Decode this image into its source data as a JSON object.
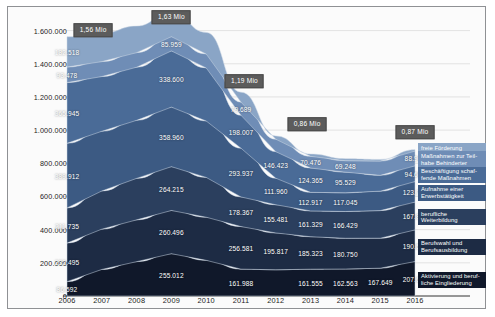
{
  "chart_data": {
    "type": "area",
    "stacked": true,
    "title": "",
    "xlabel": "",
    "ylabel": "",
    "categories": [
      "2006",
      "2007",
      "2008",
      "2009",
      "2010",
      "2011",
      "2012",
      "2013",
      "2014",
      "2015",
      "2016"
    ],
    "ylim": [
      0,
      1700000
    ],
    "yticks": [
      "0",
      "200.000",
      "400.000",
      "600.000",
      "800.000",
      "1.000.000",
      "1.200.000",
      "1.400.000",
      "1.600.000"
    ],
    "ytick_values": [
      0,
      200000,
      400000,
      600000,
      800000,
      1000000,
      1200000,
      1400000,
      1600000
    ],
    "grid": true,
    "legend_position": "right",
    "series": [
      {
        "name": "Aktivierung und berufliche Eingliederung",
        "color": "#10182a",
        "values": [
          86592,
          160000,
          207000,
          255012,
          215000,
          161988,
          158000,
          161555,
          162563,
          167649,
          207650
        ],
        "labels": [
          {
            "x": 0,
            "text": "86.592"
          },
          {
            "x": 3,
            "text": "255.012"
          },
          {
            "x": 5,
            "text": "161.988"
          },
          {
            "x": 7,
            "text": "161.555"
          },
          {
            "x": 8,
            "text": "162.563"
          },
          {
            "x": 9,
            "text": "167.649"
          },
          {
            "x": 10,
            "text": "207.650"
          }
        ]
      },
      {
        "name": "Berufswahl und Berufsausbildung",
        "color": "#1d2b44",
        "values": [
          232495,
          243000,
          252000,
          260496,
          260000,
          256581,
          222000,
          195817,
          185323,
          180750,
          190507
        ],
        "labels": [
          {
            "x": 0,
            "text": "232.495"
          },
          {
            "x": 3,
            "text": "260.496"
          },
          {
            "x": 5,
            "text": "256.581"
          },
          {
            "x": 6,
            "text": "195.817"
          },
          {
            "x": 7,
            "text": "185.323"
          },
          {
            "x": 8,
            "text": "180.750"
          },
          {
            "x": 10,
            "text": "190.507"
          }
        ]
      },
      {
        "name": "berufliche Weiterbildung",
        "color": "#2b3f5e",
        "values": [
          211735,
          230000,
          250000,
          264215,
          240000,
          178367,
          170000,
          155481,
          161329,
          166429,
          167873
        ],
        "labels": [
          {
            "x": 0,
            "text": "211.735"
          },
          {
            "x": 3,
            "text": "264.215"
          },
          {
            "x": 5,
            "text": "178.367"
          },
          {
            "x": 6,
            "text": "155.481"
          },
          {
            "x": 7,
            "text": "161.329"
          },
          {
            "x": 8,
            "text": "166.429"
          },
          {
            "x": 10,
            "text": "167.873"
          }
        ]
      },
      {
        "name": "Aufnahme einer Erwerbstätigkeit",
        "color": "#3c5a83",
        "values": [
          389912,
          360000,
          350000,
          358960,
          340000,
          293937,
          160000,
          111960,
          112917,
          117045,
          123761
        ],
        "labels": [
          {
            "x": 0,
            "text": "389.912"
          },
          {
            "x": 3,
            "text": "358.960"
          },
          {
            "x": 5,
            "text": "293.937"
          },
          {
            "x": 6,
            "text": "111.960"
          },
          {
            "x": 7,
            "text": "112.917"
          },
          {
            "x": 8,
            "text": "117.045"
          },
          {
            "x": 10,
            "text": "123.761"
          }
        ]
      },
      {
        "name": "Beschäftigung schaffende Maßnahmen",
        "color": "#4a6b97",
        "values": [
          365945,
          330000,
          320000,
          338600,
          320000,
          198007,
          160000,
          146423,
          124365,
          95529,
          94692
        ],
        "labels": [
          {
            "x": 0,
            "text": "365.945"
          },
          {
            "x": 3,
            "text": "338.600"
          },
          {
            "x": 5,
            "text": "198.007"
          },
          {
            "x": 6,
            "text": "146.423"
          },
          {
            "x": 7,
            "text": "124.365"
          },
          {
            "x": 8,
            "text": "95.529"
          },
          {
            "x": 10,
            "text": "94.692"
          }
        ]
      },
      {
        "name": "Maßnahmen zur Teilhabe Behinderter",
        "color": "#6f8db6",
        "values": [
          93478,
          90000,
          88000,
          85959,
          84000,
          79689,
          75000,
          70476,
          69248,
          86000,
          88902
        ],
        "labels": [
          {
            "x": 0,
            "text": "93.478"
          },
          {
            "x": 3,
            "text": "85.959"
          },
          {
            "x": 5,
            "text": "79.689"
          },
          {
            "x": 7,
            "text": "70.476"
          },
          {
            "x": 8,
            "text": "69.248"
          },
          {
            "x": 10,
            "text": "88.902"
          }
        ]
      },
      {
        "name": "freie Förderung",
        "color": "#8aa5c6",
        "values": [
          182518,
          170000,
          160000,
          150000,
          130000,
          60000,
          20000,
          14000,
          12000,
          10000,
          9000
        ],
        "labels": [
          {
            "x": 0,
            "text": "182.518"
          }
        ]
      }
    ],
    "annotations": [
      {
        "text": "1,56 Mio",
        "x_index": 0.75,
        "y_px": 30
      },
      {
        "text": "1,63 Mio",
        "x_index": 3.0,
        "y_px": 17
      },
      {
        "text": "1,19 Mio",
        "x_index": 5.1,
        "y_px": 81
      },
      {
        "text": "0,86 Mio",
        "x_index": 6.9,
        "y_px": 124
      },
      {
        "text": "0,87 Mio",
        "x_index": 10.0,
        "y_px": 132
      }
    ]
  },
  "legend": {
    "items": [
      {
        "label": "freie Förderung",
        "color": "#8aa5c6"
      },
      {
        "label": "Maßnahmen zur Teil-\nhabe Behinderter",
        "color": "#6f8db6"
      },
      {
        "label": "Beschäftigung schaf-\nfende Maßnahmen",
        "color": "#4a6b97"
      },
      {
        "label": "Aufnahme einer\nErwerbstätigkeit",
        "color": "#3c5a83"
      },
      {
        "label": "berufliche\nWeiterbildung",
        "color": "#2b3f5e"
      },
      {
        "label": "Berufswahl und\nBerufsausbildung",
        "color": "#1d2b44"
      },
      {
        "label": "Aktivierung und beruf-\nliche Eingliederung",
        "color": "#10182a"
      }
    ]
  }
}
